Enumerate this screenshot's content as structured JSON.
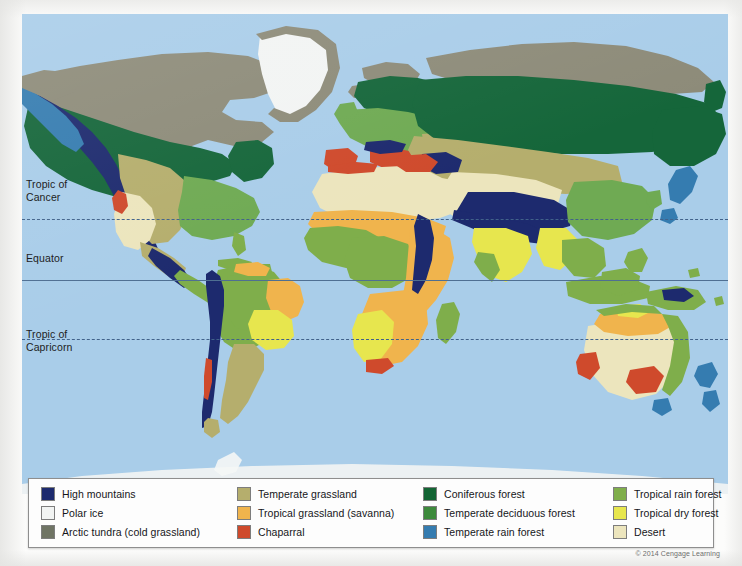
{
  "map": {
    "title": "World biomes map",
    "ocean_color": "#a9cde9",
    "page_color": "#fcfcfb",
    "latitude_lines": [
      {
        "label": "Tropic of\nCancer",
        "style": "dashed",
        "y": 205
      },
      {
        "label": "Equator",
        "style": "solid",
        "y": 266
      },
      {
        "label": "Tropic of\nCapricorn",
        "style": "dashed",
        "y": 325
      }
    ]
  },
  "legend": {
    "columns": 4,
    "items": [
      {
        "label": "High mountains",
        "color": "#1d2a6e",
        "key": "high-mountains"
      },
      {
        "label": "Polar ice",
        "color": "#f2f4f3",
        "key": "polar-ice"
      },
      {
        "label": "Arctic tundra (cold grassland)",
        "color": "#6f7464",
        "key": "arctic-tundra"
      },
      {
        "label": "Temperate grassland",
        "color": "#b5ae6d",
        "key": "temperate-grassland"
      },
      {
        "label": "Tropical grassland (savanna)",
        "color": "#f0b košo",
        "key": "tropical-grassland"
      },
      {
        "label": "Chaparral",
        "color": "#cf4a2c",
        "key": "chaparral"
      },
      {
        "label": "Coniferous forest",
        "color": "#136534",
        "key": "coniferous-forest"
      },
      {
        "label": "Temperate deciduous forest",
        "color": "#3d8a3c",
        "key": "temperate-deciduous-forest"
      },
      {
        "label": "Temperate rain forest",
        "color": "#357cb0",
        "key": "temperate-rain-forest"
      },
      {
        "label": "Tropical rain forest",
        "color": "#7fae4b",
        "key": "tropical-rain-forest"
      },
      {
        "label": "Tropical dry forest",
        "color": "#e7e64e",
        "key": "tropical-dry-forest"
      },
      {
        "label": "Desert",
        "color": "#ece5bd",
        "key": "desert"
      }
    ]
  },
  "copyright": "© 2014 Cengage Learning"
}
